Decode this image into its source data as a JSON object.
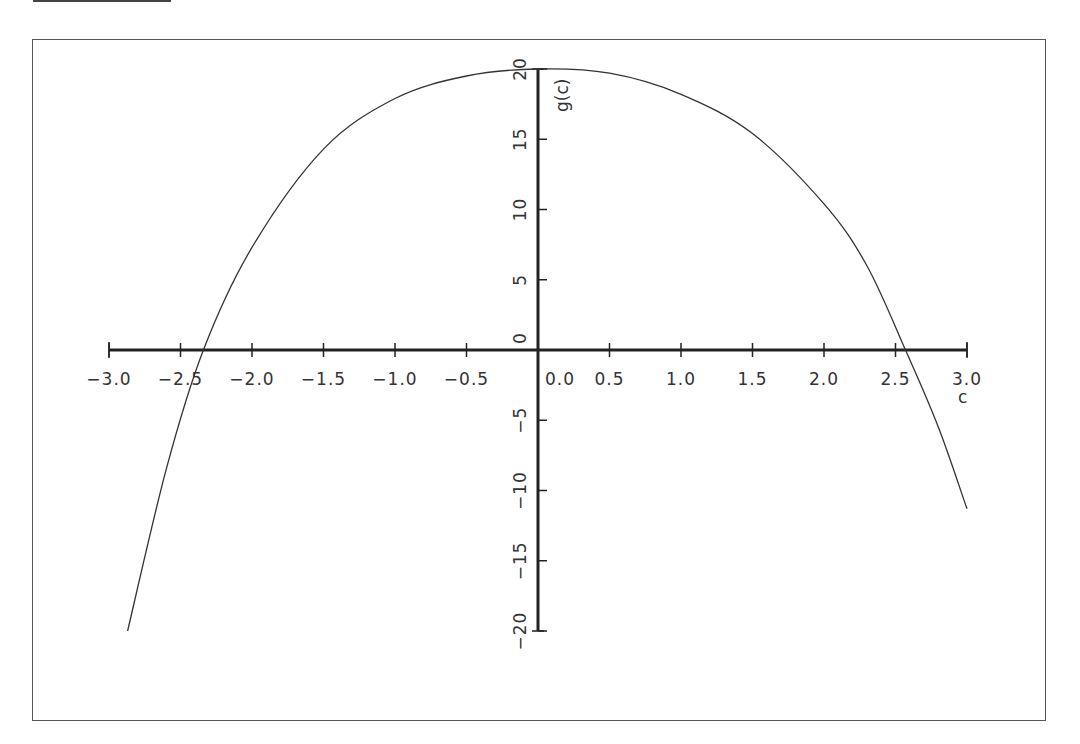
{
  "chart_data": {
    "type": "line",
    "title": "",
    "xlabel": "c",
    "ylabel": "g(c)",
    "xlim": [
      -3.0,
      3.0
    ],
    "ylim": [
      -20,
      20
    ],
    "grid": false,
    "legend": null,
    "x_ticks": [
      "−3.0",
      "−2.5",
      "−2.0",
      "−1.5",
      "−1.0",
      "−0.5",
      "0.0",
      "0.5",
      "1.0",
      "1.5",
      "2.0",
      "2.5",
      "3.0"
    ],
    "x_tick_values": [
      -3.0,
      -2.5,
      -2.0,
      -1.5,
      -1.0,
      -0.5,
      0.0,
      0.5,
      1.0,
      1.5,
      2.0,
      2.5,
      3.0
    ],
    "y_ticks": [
      "−20",
      "−15",
      "−10",
      "−5",
      "0",
      "5",
      "10",
      "15",
      "20"
    ],
    "y_tick_values": [
      -20,
      -15,
      -10,
      -5,
      0,
      5,
      10,
      15,
      20
    ],
    "series": [
      {
        "name": "g(c)",
        "x": [
          -2.87,
          -2.6,
          -2.34,
          -2.0,
          -1.5,
          -1.0,
          -0.5,
          0.0,
          0.5,
          1.0,
          1.5,
          2.0,
          2.3,
          2.57,
          2.8,
          3.0
        ],
        "y": [
          -20.0,
          -8.5,
          0.0,
          7.3,
          14.3,
          17.9,
          19.5,
          20.0,
          19.7,
          18.2,
          15.4,
          10.4,
          6.0,
          0.0,
          -5.5,
          -11.3
        ]
      }
    ],
    "roots_approx": [
      -2.34,
      2.57
    ]
  },
  "axes": {
    "x_title": "c",
    "y_title": "g(c)"
  }
}
